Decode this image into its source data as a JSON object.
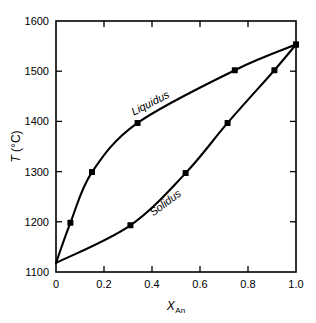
{
  "chart_data": {
    "type": "line",
    "title": "",
    "subtitle": "",
    "xlabel": "X_An",
    "xlabel_base": "X",
    "xlabel_sub": "An",
    "ylabel": "T (°C)",
    "ylabel_base": "T",
    "ylabel_unit": " (°C)",
    "xlim": [
      0,
      1.0
    ],
    "ylim": [
      1100,
      1600
    ],
    "xticks": [
      0,
      0.2,
      0.4,
      0.6,
      0.8,
      1.0
    ],
    "xtick_labels": [
      "0",
      "0.2",
      "0.4",
      "0.6",
      "0.8",
      "1.0"
    ],
    "yticks": [
      1100,
      1200,
      1300,
      1400,
      1500,
      1600
    ],
    "ytick_labels": [
      "1100",
      "1200",
      "1300",
      "1400",
      "1500",
      "1600"
    ],
    "xminor_count": 0,
    "grid": false,
    "legend_position": "inline-curve-labels",
    "frame": true,
    "tick_direction": "in",
    "line_color": "#000000",
    "marker_color": "#000000",
    "marker_shape": "square",
    "background": "#ffffff",
    "annotations": [
      {
        "name": "liquidus-label",
        "text": "Liquidus",
        "x": 0.4,
        "y": 1430,
        "rotation": -27
      },
      {
        "name": "solidus-label",
        "text": "Solidus",
        "x": 0.465,
        "y": 1232,
        "rotation": -37
      }
    ],
    "series": [
      {
        "name": "Liquidus",
        "points": [
          {
            "x": 0.0,
            "y": 1118
          },
          {
            "x": 0.06,
            "y": 1198
          },
          {
            "x": 0.15,
            "y": 1299
          },
          {
            "x": 0.34,
            "y": 1397
          },
          {
            "x": 0.745,
            "y": 1502
          },
          {
            "x": 1.0,
            "y": 1553
          }
        ],
        "marker_points": [
          {
            "x": 0.06,
            "y": 1198
          },
          {
            "x": 0.15,
            "y": 1299
          },
          {
            "x": 0.34,
            "y": 1397
          },
          {
            "x": 0.745,
            "y": 1502
          },
          {
            "x": 1.0,
            "y": 1553
          }
        ]
      },
      {
        "name": "Solidus",
        "points": [
          {
            "x": 0.0,
            "y": 1118
          },
          {
            "x": 0.31,
            "y": 1193
          },
          {
            "x": 0.54,
            "y": 1297
          },
          {
            "x": 0.715,
            "y": 1397
          },
          {
            "x": 0.91,
            "y": 1502
          },
          {
            "x": 1.0,
            "y": 1553
          }
        ],
        "marker_points": [
          {
            "x": 0.31,
            "y": 1193
          },
          {
            "x": 0.54,
            "y": 1297
          },
          {
            "x": 0.715,
            "y": 1397
          },
          {
            "x": 0.91,
            "y": 1502
          },
          {
            "x": 1.0,
            "y": 1553
          }
        ]
      }
    ]
  }
}
